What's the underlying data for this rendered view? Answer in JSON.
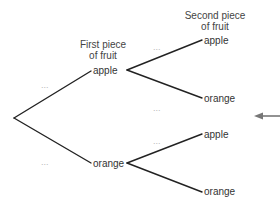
{
  "headers": {
    "first": {
      "line1": "First piece",
      "line2": "of fruit"
    },
    "second": {
      "line1": "Second piece",
      "line2": "of fruit"
    }
  },
  "first_level": {
    "top": "apple",
    "bottom": "orange"
  },
  "second_level": {
    "top_top": "apple",
    "top_bottom": "orange",
    "bottom_top": "apple",
    "bottom_bottom": "orange"
  },
  "placeholders": {
    "root_to_apple": "...",
    "root_to_orange": "...",
    "apple_to_apple": "...",
    "apple_to_orange": "...",
    "orange_to_apple": "..."
  },
  "pointer": {
    "icon": "left-arrow-icon",
    "color": "#777777"
  },
  "colors": {
    "branch_line": "#222222",
    "label_text": "#333333",
    "placeholder_text": "#b8b8b8"
  }
}
